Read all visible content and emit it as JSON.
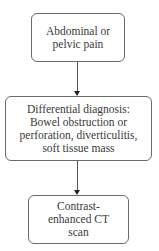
{
  "diagram": {
    "type": "flowchart",
    "direction": "top-to-bottom",
    "nodes": [
      {
        "id": "n1",
        "lines": [
          "Abdominal or",
          "pelvic pain"
        ]
      },
      {
        "id": "n2",
        "lines": [
          "Differential diagnosis:",
          "Bowel obstruction or",
          "perforation, diverticulitis,",
          "soft tissue mass"
        ]
      },
      {
        "id": "n3",
        "lines": [
          "Contrast-",
          "enhanced CT",
          "scan"
        ]
      }
    ],
    "edges": [
      {
        "from": "n1",
        "to": "n2"
      },
      {
        "from": "n2",
        "to": "n3"
      }
    ],
    "colors": {
      "border": "#6a6a6a",
      "text": "#3a3a3a",
      "arrow": "#222222",
      "background": "#ffffff"
    }
  }
}
